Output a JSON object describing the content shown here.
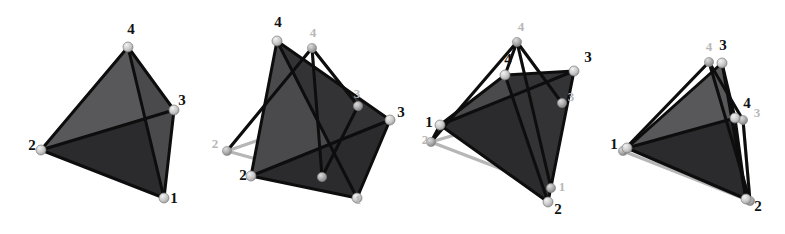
{
  "figure": {
    "background_color": "#ffffff",
    "panel_count": 4,
    "vertex_label_set": [
      "1",
      "2",
      "3",
      "4"
    ],
    "colors": {
      "face_light": "#58585a",
      "face_mid": "#4a4a4c",
      "face_dark": "#333335",
      "face_darkest": "#2b2b2d",
      "edge_dark": "#0d0d0d",
      "edge_gray": "#b0b0b0",
      "node_light": "#cfcfcf",
      "node_gray": "#9a9a9a",
      "label_dark": "#111111",
      "label_gray": "#b8b8b8",
      "background": "#ffffff"
    },
    "panels": [
      {
        "id": "panel-1",
        "name": "single-tetrahedron",
        "labels": [
          {
            "text": "4",
            "x": 131,
            "y": 34,
            "tone": "dark"
          },
          {
            "text": "3",
            "x": 182,
            "y": 105,
            "tone": "dark"
          },
          {
            "text": "2",
            "x": 32,
            "y": 150,
            "tone": "dark"
          },
          {
            "text": "1",
            "x": 174,
            "y": 203,
            "tone": "dark"
          }
        ],
        "dark_vertices": [
          {
            "label": "4",
            "x": 128,
            "y": 47
          },
          {
            "label": "3",
            "x": 174,
            "y": 110
          },
          {
            "label": "2",
            "x": 41,
            "y": 150
          },
          {
            "label": "1",
            "x": 164,
            "y": 198
          }
        ],
        "gray_vertices": [],
        "dark_faces": [
          {
            "points": "128,47 174,110 41,150",
            "shade": "face_light"
          },
          {
            "points": "41,150 174,110 164,198",
            "shade": "face_darkest"
          },
          {
            "points": "128,47 174,110 164,198",
            "shade": "face_mid"
          }
        ],
        "gray_faces": [],
        "dark_edges": [
          "128,47 174,110",
          "128,47 41,150",
          "128,47 164,198",
          "174,110 41,150",
          "174,110 164,198",
          "41,150 164,198"
        ],
        "gray_edges": []
      },
      {
        "id": "panel-2",
        "name": "two-tetrahedra-far-apart",
        "labels": [
          {
            "text": "4",
            "x": 278,
            "y": 27,
            "tone": "dark"
          },
          {
            "text": "4",
            "x": 313,
            "y": 37,
            "tone": "gray"
          },
          {
            "text": "3",
            "x": 401,
            "y": 117,
            "tone": "dark"
          },
          {
            "text": "3",
            "x": 357,
            "y": 98,
            "tone": "gray"
          },
          {
            "text": "2",
            "x": 243,
            "y": 180,
            "tone": "dark"
          },
          {
            "text": "2",
            "x": 215,
            "y": 148,
            "tone": "gray"
          },
          {
            "text": "1",
            "x": 358,
            "y": 204,
            "tone": "gray"
          }
        ],
        "dark_vertices": [
          {
            "label": "4",
            "x": 277,
            "y": 41
          },
          {
            "label": "3",
            "x": 390,
            "y": 120
          },
          {
            "label": "2",
            "x": 251,
            "y": 176
          },
          {
            "label": "1",
            "x": 357,
            "y": 198
          }
        ],
        "gray_vertices": [
          {
            "label": "4",
            "x": 312,
            "y": 48
          },
          {
            "label": "3",
            "x": 358,
            "y": 106
          },
          {
            "label": "2",
            "x": 227,
            "y": 151
          },
          {
            "label": "1",
            "x": 322,
            "y": 177
          }
        ],
        "dark_faces": [
          {
            "points": "277,41 390,120 251,176",
            "shade": "face_mid"
          },
          {
            "points": "277,41 390,120 357,198",
            "shade": "face_dark"
          },
          {
            "points": "251,176 390,120 357,198",
            "shade": "face_darkest"
          }
        ],
        "gray_faces": [],
        "dark_edges": [
          "277,41 390,120",
          "277,41 251,176",
          "277,41 357,198",
          "390,120 251,176",
          "390,120 357,198",
          "251,176 357,198",
          "312,48 358,106",
          "312,48 227,151",
          "312,48 322,177",
          "358,106 322,177"
        ],
        "gray_edges": [
          "312,48 358,106",
          "312,48 227,151",
          "358,106 227,151",
          "358,106 322,177",
          "227,151 322,177",
          "312,48 322,177"
        ]
      },
      {
        "id": "panel-3",
        "name": "two-tetrahedra-partially-aligned",
        "labels": [
          {
            "text": "4",
            "x": 521,
            "y": 31,
            "tone": "gray"
          },
          {
            "text": "4",
            "x": 508,
            "y": 64,
            "tone": "dark"
          },
          {
            "text": "3",
            "x": 588,
            "y": 62,
            "tone": "dark"
          },
          {
            "text": "1",
            "x": 429,
            "y": 127,
            "tone": "dark"
          },
          {
            "text": "1",
            "x": 562,
            "y": 191,
            "tone": "gray"
          },
          {
            "text": "2",
            "x": 558,
            "y": 214,
            "tone": "dark"
          },
          {
            "text": "3",
            "x": 571,
            "y": 101,
            "tone": "gray"
          },
          {
            "text": "2",
            "x": 425,
            "y": 144,
            "tone": "gray"
          }
        ],
        "dark_vertices": [
          {
            "label": "4",
            "x": 505,
            "y": 75
          },
          {
            "label": "3",
            "x": 574,
            "y": 71
          },
          {
            "label": "1",
            "x": 440,
            "y": 125
          },
          {
            "label": "2",
            "x": 548,
            "y": 202
          }
        ],
        "gray_vertices": [
          {
            "label": "4",
            "x": 517,
            "y": 42
          },
          {
            "label": "3",
            "x": 562,
            "y": 103
          },
          {
            "label": "1",
            "x": 551,
            "y": 188
          },
          {
            "label": "2",
            "x": 431,
            "y": 142
          }
        ],
        "dark_faces": [
          {
            "points": "505,75 574,71 440,125",
            "shade": "face_mid"
          },
          {
            "points": "440,125 574,71 548,202",
            "shade": "face_darkest"
          },
          {
            "points": "505,75 574,71 548,202",
            "shade": "face_dark"
          }
        ],
        "gray_faces": [],
        "dark_edges": [
          "505,75 574,71",
          "505,75 440,125",
          "505,75 548,202",
          "574,71 440,125",
          "574,71 548,202",
          "440,125 548,202",
          "517,42 505,75",
          "517,42 562,103",
          "517,42 431,142",
          "517,42 551,188",
          "440,125 431,142"
        ],
        "gray_edges": [
          "517,42 562,103",
          "517,42 431,142",
          "517,42 551,188",
          "562,103 431,142",
          "562,103 551,188",
          "431,142 551,188"
        ]
      },
      {
        "id": "panel-4",
        "name": "two-tetrahedra-nearly-registered",
        "labels": [
          {
            "text": "4",
            "x": 709,
            "y": 51,
            "tone": "gray"
          },
          {
            "text": "3",
            "x": 723,
            "y": 50,
            "tone": "dark"
          },
          {
            "text": "4",
            "x": 747,
            "y": 108,
            "tone": "dark"
          },
          {
            "text": "3",
            "x": 757,
            "y": 117,
            "tone": "gray"
          },
          {
            "text": "1",
            "x": 614,
            "y": 149,
            "tone": "dark"
          },
          {
            "text": "2",
            "x": 758,
            "y": 211,
            "tone": "dark"
          }
        ],
        "dark_vertices": [
          {
            "label": "3",
            "x": 722,
            "y": 63
          },
          {
            "label": "4",
            "x": 735,
            "y": 118
          },
          {
            "label": "1",
            "x": 627,
            "y": 148
          },
          {
            "label": "2",
            "x": 746,
            "y": 199
          }
        ],
        "gray_vertices": [
          {
            "label": "4",
            "x": 709,
            "y": 62
          },
          {
            "label": "3",
            "x": 743,
            "y": 120
          },
          {
            "label": "1",
            "x": 623,
            "y": 151
          },
          {
            "label": "2",
            "x": 750,
            "y": 201
          }
        ],
        "dark_faces": [
          {
            "points": "722,63 735,118 627,148",
            "shade": "face_light"
          },
          {
            "points": "627,148 735,118 746,199",
            "shade": "face_darkest"
          },
          {
            "points": "722,63 735,118 746,199",
            "shade": "face_dark"
          }
        ],
        "gray_faces": [],
        "dark_edges": [
          "722,63 735,118",
          "722,63 627,148",
          "722,63 746,199",
          "735,118 627,148",
          "735,118 746,199",
          "627,148 746,199",
          "709,62 743,120",
          "709,62 623,151",
          "743,120 750,201",
          "709,62 750,201"
        ],
        "gray_edges": [
          "709,62 743,120",
          "709,62 623,151",
          "743,120 623,151",
          "743,120 750,201",
          "623,151 750,201",
          "709,62 750,201"
        ]
      }
    ]
  }
}
